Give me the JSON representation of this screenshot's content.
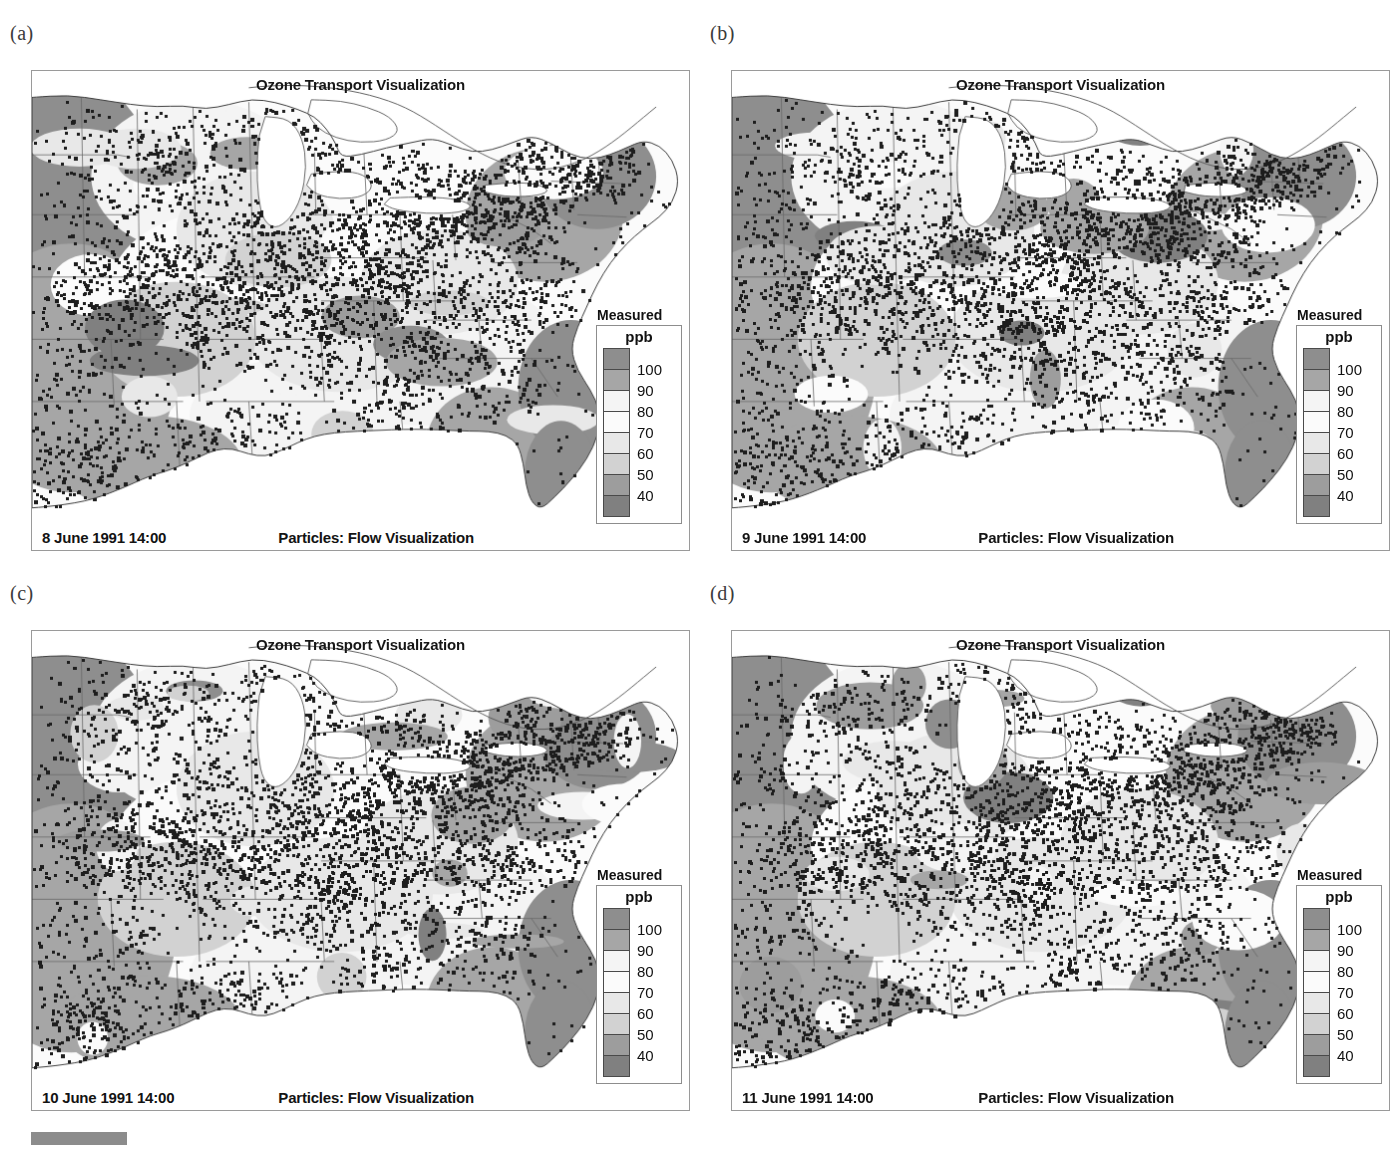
{
  "figure": {
    "panel_labels": [
      "(a)",
      "(b)",
      "(c)",
      "(d)"
    ]
  },
  "panels": [
    {
      "label": "(a)",
      "title": "Ozone Transport Visualization",
      "date": "8 June 1991 14:00",
      "caption": "Particles: Flow Visualization",
      "legend": {
        "title": "Measured",
        "unit": "ppb",
        "ticks": [
          "100",
          "90",
          "80",
          "70",
          "60",
          "50",
          "40"
        ]
      }
    },
    {
      "label": "(b)",
      "title": "Ozone Transport Visualization",
      "date": "9 June 1991 14:00",
      "caption": "Particles: Flow Visualization",
      "legend": {
        "title": "Measured",
        "unit": "ppb",
        "ticks": [
          "100",
          "90",
          "80",
          "70",
          "60",
          "50",
          "40"
        ]
      }
    },
    {
      "label": "(c)",
      "title": "Ozone Transport Visualization",
      "date": "10 June 1991 14:00",
      "caption": "Particles: Flow Visualization",
      "legend": {
        "title": "Measured",
        "unit": "ppb",
        "ticks": [
          "100",
          "90",
          "80",
          "70",
          "60",
          "50",
          "40"
        ]
      }
    },
    {
      "label": "(d)",
      "title": "Ozone Transport Visualization",
      "date": "11 June 1991 14:00",
      "caption": "Particles: Flow Visualization",
      "legend": {
        "title": "Measured",
        "unit": "ppb",
        "ticks": [
          "100",
          "90",
          "80",
          "70",
          "60",
          "50",
          "40"
        ]
      }
    }
  ],
  "chart_data": {
    "type": "heatmap",
    "title": "Ozone Transport Visualization",
    "subtitle": "Particles: Flow Visualization",
    "variable": "Measured ozone",
    "units": "ppb",
    "legend_position": "right-inside",
    "colorbar_levels": [
      100,
      90,
      80,
      70,
      60,
      50,
      40
    ],
    "colorbar_colors": [
      "#8e8e8e",
      "#a6a6a6",
      "#f4f4f4",
      "#fbfbfb",
      "#e8e8e8",
      "#d2d2d2",
      "#9d9d9d",
      "#808080"
    ],
    "frames": [
      {
        "panel": "(a)",
        "timestamp": "8 June 1991 14:00",
        "particle_count": 2600
      },
      {
        "panel": "(b)",
        "timestamp": "9 June 1991 14:00",
        "particle_count": 2450
      },
      {
        "panel": "(c)",
        "timestamp": "10 June 1991 14:00",
        "particle_count": 2700
      },
      {
        "panel": "(d)",
        "timestamp": "11 June 1991 14:00",
        "particle_count": 2500
      }
    ],
    "region": "Eastern United States",
    "grid": false,
    "xlabel": "",
    "ylabel": ""
  }
}
